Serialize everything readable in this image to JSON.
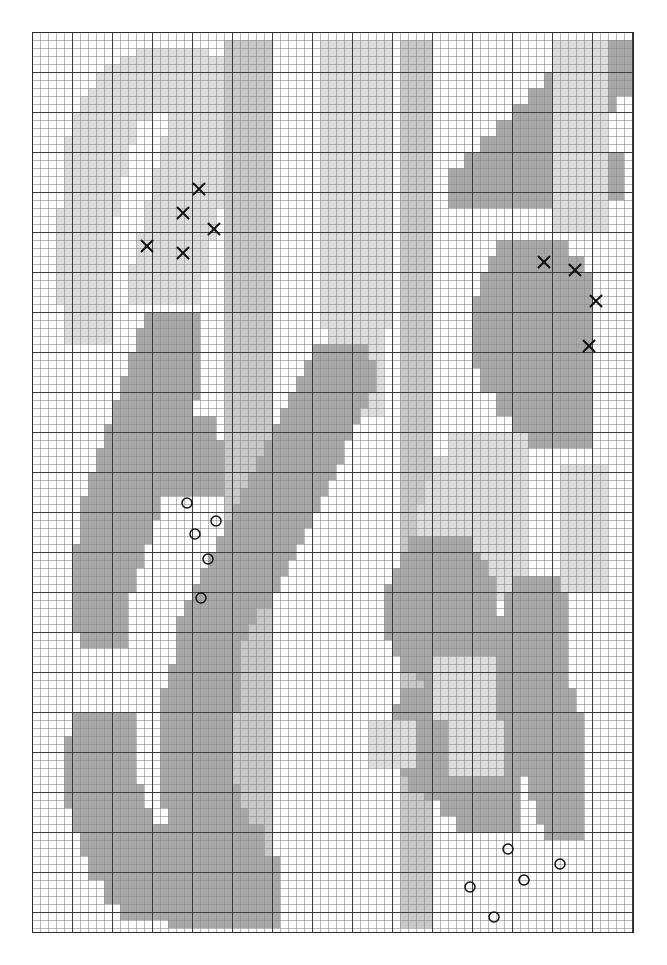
{
  "figure": {
    "title": "",
    "background_color": "#ffffff",
    "plot_left": 32,
    "plot_top": 32,
    "plot_width": 601,
    "plot_height": 900
  },
  "grid": {
    "minor_cell_px": 8,
    "major_every_cells": 5,
    "minor_color": "#8c8c8c",
    "major_color": "#3c3c3c",
    "frame_color": "#2b2b2b",
    "cols": 75,
    "rows": 112,
    "visible": true
  },
  "chart_data": {
    "type": "heatmap",
    "title": "",
    "xlabel": "",
    "ylabel": "",
    "xlim": [
      0,
      75
    ],
    "ylim": [
      0,
      112
    ],
    "grid": true,
    "legend_position": "none",
    "colors": {
      "empty": "#ffffff",
      "light": "#dcdcdc",
      "mid": "#c9c9c9",
      "dark": "#a8a8a8"
    },
    "legend_entries": [
      {
        "name": "cross-marker-class",
        "symbol": "x",
        "color": "#111111"
      },
      {
        "name": "circle-marker-class",
        "symbol": "o",
        "color": "#111111"
      }
    ],
    "cell_size": 8,
    "origin": [
      32,
      32
    ],
    "regions": [
      {
        "shade": "light",
        "comment": "upper-left crescent leaf",
        "rects": [
          [
            13,
            2,
            9,
            3
          ],
          [
            11,
            3,
            13,
            3
          ],
          [
            9,
            4,
            17,
            3
          ],
          [
            8,
            5,
            19,
            4
          ],
          [
            7,
            7,
            12,
            3
          ],
          [
            6,
            8,
            9,
            3
          ],
          [
            18,
            7,
            9,
            4
          ],
          [
            5,
            10,
            8,
            4
          ],
          [
            17,
            10,
            9,
            4
          ],
          [
            4,
            13,
            8,
            5
          ],
          [
            16,
            13,
            9,
            5
          ],
          [
            4,
            17,
            7,
            6
          ],
          [
            15,
            17,
            9,
            5
          ],
          [
            3,
            22,
            7,
            7
          ],
          [
            14,
            21,
            9,
            5
          ],
          [
            3,
            28,
            7,
            6
          ],
          [
            13,
            25,
            9,
            5
          ],
          [
            4,
            33,
            6,
            6
          ],
          [
            12,
            29,
            9,
            5
          ]
        ]
      },
      {
        "shade": "light",
        "comment": "upper-mid light column band",
        "rects": [
          [
            36,
            1,
            9,
            36
          ],
          [
            37,
            36,
            7,
            12
          ]
        ]
      },
      {
        "shade": "mid",
        "comment": "left vertical stripe band",
        "rects": [
          [
            24,
            1,
            6,
            111
          ]
        ]
      },
      {
        "shade": "mid",
        "comment": "center vertical stripe band",
        "rects": [
          [
            46,
            1,
            4,
            111
          ]
        ]
      },
      {
        "shade": "dark",
        "comment": "left mid leaf blade",
        "rects": [
          [
            14,
            35,
            7,
            5
          ],
          [
            13,
            37,
            8,
            6
          ],
          [
            12,
            40,
            9,
            6
          ],
          [
            11,
            43,
            9,
            6
          ],
          [
            10,
            46,
            9,
            6
          ],
          [
            9,
            49,
            9,
            6
          ],
          [
            8,
            52,
            9,
            6
          ],
          [
            7,
            55,
            9,
            6
          ],
          [
            6,
            58,
            9,
            6
          ],
          [
            6,
            61,
            8,
            6
          ],
          [
            5,
            64,
            8,
            6
          ],
          [
            5,
            67,
            7,
            6
          ],
          [
            5,
            70,
            7,
            5
          ],
          [
            6,
            73,
            6,
            4
          ]
        ]
      },
      {
        "shade": "dark",
        "comment": "left horizontal leaf",
        "rects": [
          [
            11,
            48,
            12,
            4
          ],
          [
            12,
            51,
            12,
            4
          ],
          [
            13,
            54,
            11,
            4
          ]
        ]
      },
      {
        "shade": "dark",
        "comment": "lower-left long leaf",
        "rects": [
          [
            5,
            85,
            8,
            5
          ],
          [
            4,
            88,
            9,
            6
          ],
          [
            4,
            91,
            9,
            6
          ],
          [
            5,
            94,
            9,
            6
          ],
          [
            6,
            97,
            9,
            6
          ],
          [
            7,
            100,
            9,
            6
          ],
          [
            9,
            103,
            9,
            6
          ],
          [
            11,
            106,
            9,
            5
          ]
        ]
      },
      {
        "shade": "dark",
        "comment": "lower-centre upright leaf",
        "rects": [
          [
            19,
            74,
            6,
            4
          ],
          [
            18,
            76,
            8,
            5
          ],
          [
            17,
            79,
            9,
            6
          ],
          [
            16,
            82,
            9,
            6
          ],
          [
            16,
            85,
            9,
            6
          ],
          [
            16,
            88,
            9,
            6
          ],
          [
            16,
            91,
            9,
            6
          ],
          [
            17,
            94,
            9,
            6
          ],
          [
            18,
            97,
            9,
            6
          ],
          [
            19,
            100,
            9,
            6
          ],
          [
            20,
            103,
            9,
            6
          ],
          [
            21,
            106,
            8,
            5
          ]
        ]
      },
      {
        "shade": "dark",
        "comment": "lower-left bottom wedge",
        "rects": [
          [
            13,
            99,
            16,
            5
          ],
          [
            15,
            103,
            16,
            5
          ],
          [
            17,
            107,
            14,
            5
          ]
        ]
      },
      {
        "shade": "dark",
        "comment": "upper-right big leaf top",
        "rects": [
          [
            68,
            1,
            7,
            5
          ],
          [
            66,
            3,
            9,
            5
          ],
          [
            64,
            5,
            9,
            5
          ],
          [
            62,
            7,
            9,
            5
          ],
          [
            60,
            9,
            9,
            5
          ],
          [
            58,
            11,
            9,
            5
          ],
          [
            56,
            13,
            9,
            5
          ],
          [
            54,
            15,
            9,
            5
          ],
          [
            52,
            17,
            9,
            5
          ],
          [
            55,
            17,
            12,
            5
          ],
          [
            60,
            15,
            14,
            6
          ]
        ]
      },
      {
        "shade": "dark",
        "comment": "right mid diagonal leaf",
        "rects": [
          [
            35,
            39,
            7,
            4
          ],
          [
            34,
            41,
            9,
            4
          ],
          [
            33,
            43,
            9,
            4
          ],
          [
            32,
            45,
            9,
            4
          ],
          [
            31,
            47,
            9,
            4
          ],
          [
            30,
            49,
            9,
            5
          ],
          [
            29,
            51,
            9,
            5
          ],
          [
            28,
            53,
            9,
            5
          ],
          [
            27,
            55,
            9,
            5
          ],
          [
            26,
            57,
            9,
            5
          ],
          [
            25,
            59,
            9,
            5
          ],
          [
            24,
            61,
            9,
            5
          ],
          [
            23,
            63,
            9,
            5
          ],
          [
            22,
            65,
            9,
            5
          ],
          [
            21,
            67,
            9,
            5
          ],
          [
            20,
            69,
            8,
            5
          ],
          [
            19,
            71,
            8,
            5
          ],
          [
            18,
            73,
            8,
            5
          ]
        ]
      },
      {
        "shade": "dark",
        "comment": "right upper leaf mass",
        "rects": [
          [
            58,
            26,
            9,
            5
          ],
          [
            57,
            28,
            12,
            5
          ],
          [
            56,
            30,
            14,
            6
          ],
          [
            55,
            33,
            15,
            6
          ],
          [
            55,
            36,
            15,
            6
          ],
          [
            56,
            39,
            14,
            6
          ],
          [
            58,
            42,
            12,
            6
          ],
          [
            60,
            45,
            10,
            5
          ],
          [
            62,
            47,
            8,
            5
          ]
        ]
      },
      {
        "shade": "light",
        "comment": "right lower light mass",
        "rects": [
          [
            52,
            50,
            10,
            6
          ],
          [
            50,
            53,
            12,
            6
          ],
          [
            49,
            56,
            13,
            6
          ],
          [
            48,
            59,
            14,
            6
          ],
          [
            48,
            62,
            14,
            6
          ],
          [
            49,
            65,
            13,
            6
          ]
        ]
      },
      {
        "shade": "dark",
        "comment": "right mid-lower leaf",
        "rects": [
          [
            47,
            63,
            8,
            5
          ],
          [
            46,
            65,
            10,
            5
          ],
          [
            45,
            67,
            11,
            5
          ],
          [
            44,
            69,
            12,
            5
          ],
          [
            44,
            71,
            12,
            5
          ],
          [
            45,
            73,
            11,
            5
          ],
          [
            46,
            75,
            10,
            5
          ],
          [
            48,
            77,
            8,
            4
          ]
        ]
      },
      {
        "shade": "dark",
        "comment": "lower-right leaf A",
        "rects": [
          [
            46,
            82,
            7,
            4
          ],
          [
            45,
            84,
            9,
            4
          ],
          [
            45,
            86,
            10,
            5
          ],
          [
            46,
            88,
            10,
            5
          ],
          [
            47,
            90,
            10,
            5
          ],
          [
            49,
            92,
            9,
            4
          ],
          [
            51,
            94,
            8,
            4
          ],
          [
            53,
            96,
            6,
            4
          ]
        ]
      },
      {
        "shade": "dark",
        "comment": "lower-right leaf B upright",
        "rects": [
          [
            51,
            66,
            6,
            4
          ],
          [
            50,
            68,
            8,
            5
          ],
          [
            49,
            71,
            9,
            5
          ],
          [
            49,
            74,
            9,
            5
          ],
          [
            49,
            77,
            9,
            5
          ],
          [
            50,
            80,
            9,
            5
          ],
          [
            51,
            83,
            9,
            5
          ],
          [
            52,
            86,
            9,
            5
          ],
          [
            53,
            89,
            8,
            5
          ],
          [
            54,
            92,
            7,
            5
          ],
          [
            55,
            95,
            6,
            5
          ]
        ]
      },
      {
        "shade": "dark",
        "comment": "lower-right leaf C",
        "rects": [
          [
            60,
            68,
            6,
            4
          ],
          [
            59,
            70,
            8,
            5
          ],
          [
            58,
            73,
            9,
            5
          ],
          [
            58,
            76,
            9,
            5
          ],
          [
            58,
            79,
            9,
            5
          ],
          [
            59,
            82,
            9,
            5
          ],
          [
            60,
            85,
            9,
            5
          ],
          [
            61,
            88,
            8,
            5
          ],
          [
            62,
            91,
            7,
            5
          ],
          [
            63,
            94,
            6,
            5
          ],
          [
            64,
            97,
            5,
            4
          ]
        ]
      },
      {
        "shade": "light",
        "comment": "right column light stripe",
        "rects": [
          [
            65,
            1,
            7,
            24
          ],
          [
            66,
            54,
            6,
            16
          ]
        ]
      },
      {
        "shade": "light",
        "comment": "mid-right faint blocks",
        "rects": [
          [
            50,
            78,
            8,
            8
          ],
          [
            52,
            86,
            7,
            7
          ],
          [
            42,
            86,
            6,
            6
          ]
        ]
      }
    ],
    "markers": {
      "cross": {
        "symbol": "x",
        "color": "#111111",
        "size_px": 11,
        "points": [
          {
            "x": 199,
            "y": 189
          },
          {
            "x": 183,
            "y": 213
          },
          {
            "x": 214,
            "y": 229
          },
          {
            "x": 147,
            "y": 246
          },
          {
            "x": 183,
            "y": 253
          },
          {
            "x": 544,
            "y": 262
          },
          {
            "x": 575,
            "y": 270
          },
          {
            "x": 596,
            "y": 301
          },
          {
            "x": 589,
            "y": 346
          }
        ]
      },
      "circle": {
        "symbol": "o",
        "color": "#111111",
        "radius_px": 5,
        "points": [
          {
            "x": 187,
            "y": 503
          },
          {
            "x": 216,
            "y": 521
          },
          {
            "x": 195,
            "y": 534
          },
          {
            "x": 208,
            "y": 559
          },
          {
            "x": 201,
            "y": 598
          },
          {
            "x": 508,
            "y": 849
          },
          {
            "x": 560,
            "y": 864
          },
          {
            "x": 524,
            "y": 880
          },
          {
            "x": 470,
            "y": 887
          },
          {
            "x": 494,
            "y": 917
          }
        ]
      }
    }
  }
}
